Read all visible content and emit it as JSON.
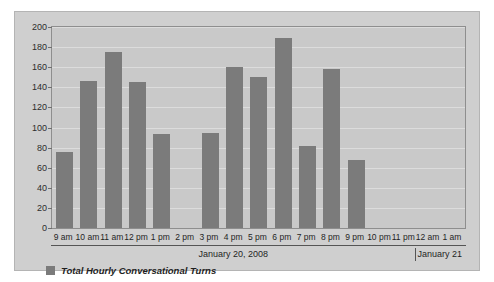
{
  "chart_data": {
    "type": "bar",
    "title": "",
    "xlabel": "",
    "ylabel": "",
    "ylim": [
      0,
      200
    ],
    "ytick_step": 20,
    "grid": true,
    "legend_position": "bottom-left",
    "bar_color": "#7b7b7b",
    "plot_background": "#c9c9c9",
    "panel_background": "#cfcfcf",
    "gridline_color": "#dcdcdc",
    "categories": [
      "9 am",
      "10 am",
      "11 am",
      "12 pm",
      "1 pm",
      "2 pm",
      "3 pm",
      "4 pm",
      "5 pm",
      "6 pm",
      "7 pm",
      "8 pm",
      "9 pm",
      "10 pm",
      "11 pm",
      "12 am",
      "1 am"
    ],
    "series": [
      {
        "name": "Total Hourly Conversational Turns",
        "values": [
          76,
          146,
          175,
          145,
          94,
          0,
          95,
          160,
          150,
          189,
          82,
          158,
          68,
          0,
          0,
          0,
          0
        ]
      }
    ],
    "yticks": [
      0,
      20,
      40,
      60,
      80,
      100,
      120,
      140,
      160,
      180,
      200
    ],
    "ytick_labels": [
      "0",
      "20",
      "40",
      "60",
      "80",
      "100",
      "120",
      "140",
      "160",
      "180",
      "200"
    ],
    "annotations": {
      "date_bands": [
        {
          "label": "January 20, 2008",
          "start_category": "9 am",
          "end_category": "11 pm"
        },
        {
          "label": "January 21",
          "start_category": "12 am",
          "end_category": "1 am"
        }
      ]
    }
  },
  "legend": {
    "items": [
      {
        "label": "Total Hourly Conversational Turns",
        "color": "#7b7b7b"
      }
    ]
  }
}
